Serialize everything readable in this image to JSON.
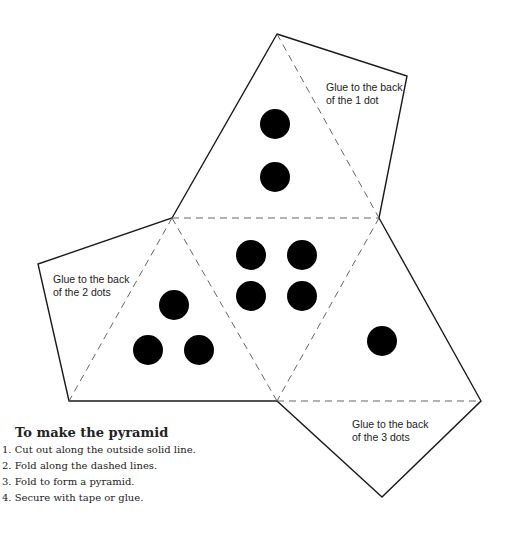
{
  "diagram": {
    "type": "pyramid-net",
    "faces": [
      {
        "position": "top",
        "dots": 2
      },
      {
        "position": "center",
        "dots": 4
      },
      {
        "position": "left",
        "dots": 3
      },
      {
        "position": "right",
        "dots": 1
      }
    ],
    "glue_tabs": [
      {
        "position": "top-right",
        "line1": "Glue to the back",
        "line2": "of the 1 dot"
      },
      {
        "position": "left",
        "line1": "Glue to the back",
        "line2": "of the 2 dots"
      },
      {
        "position": "bottom-right",
        "line1": "Glue to the back",
        "line2": "of the 3 dots"
      }
    ],
    "colors": {
      "ink": "#000000",
      "fold_line": "#555555",
      "background": "#ffffff"
    }
  },
  "instructions": {
    "title": "To make the pyramid",
    "steps": [
      "1. Cut out along the outside solid line.",
      "2. Fold along the dashed lines.",
      "3. Fold to form a pyramid.",
      "4. Secure with tape or glue."
    ]
  }
}
